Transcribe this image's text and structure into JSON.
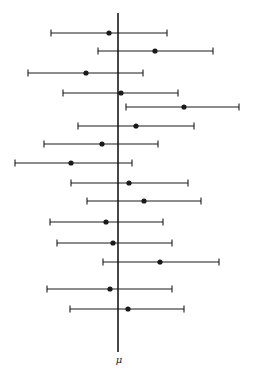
{
  "figure": {
    "axis_label": "μ",
    "line_color": "#1a1a1a",
    "mean_line_x": 118,
    "mean_line_top": 13,
    "mean_line_bottom": 352
  },
  "chart_data": {
    "type": "interval",
    "title": "",
    "xlabel": "μ",
    "ylabel": "",
    "intervals": [
      {
        "y": 33,
        "low": 51,
        "point": 109,
        "high": 167
      },
      {
        "y": 51,
        "low": 98,
        "point": 155,
        "high": 213
      },
      {
        "y": 73,
        "low": 28,
        "point": 86,
        "high": 143
      },
      {
        "y": 93,
        "low": 63,
        "point": 121,
        "high": 178
      },
      {
        "y": 107,
        "low": 126,
        "point": 184,
        "high": 239
      },
      {
        "y": 126,
        "low": 78,
        "point": 136,
        "high": 194
      },
      {
        "y": 144,
        "low": 44,
        "point": 102,
        "high": 158
      },
      {
        "y": 163,
        "low": 15,
        "point": 71,
        "high": 132
      },
      {
        "y": 183,
        "low": 71,
        "point": 129,
        "high": 188
      },
      {
        "y": 201,
        "low": 87,
        "point": 144,
        "high": 201
      },
      {
        "y": 222,
        "low": 50,
        "point": 106,
        "high": 163
      },
      {
        "y": 243,
        "low": 57,
        "point": 113,
        "high": 172
      },
      {
        "y": 262,
        "low": 103,
        "point": 160,
        "high": 219
      },
      {
        "y": 289,
        "low": 47,
        "point": 110,
        "high": 172
      },
      {
        "y": 309,
        "low": 70,
        "point": 128,
        "high": 184
      }
    ]
  }
}
